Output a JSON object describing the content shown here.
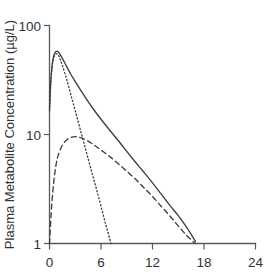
{
  "chart_data": {
    "type": "line",
    "title": "",
    "subtitle": "",
    "xlabel": "",
    "ylabel": "Plasma Metabolite Concentration (µg/L)",
    "yscale": "log",
    "xscale": "linear",
    "xlim": [
      0,
      24
    ],
    "ylim": [
      1,
      100
    ],
    "xticks": [
      0,
      6,
      12,
      18,
      24
    ],
    "xticklabels": [
      "0",
      "6",
      "12",
      "18",
      "24"
    ],
    "yticks": [
      1,
      10,
      100
    ],
    "yticklabels": [
      "1",
      "10",
      "100"
    ],
    "grid": false,
    "legend": "none",
    "series": [
      {
        "name": "total-concentration",
        "style": "solid",
        "color": "#3b3f43",
        "x": [
          0.0,
          0.15,
          0.3,
          0.45,
          0.6,
          0.8,
          1.0,
          1.2,
          1.5,
          2.0,
          2.5,
          3.0,
          4.0,
          5.0,
          6.0,
          7.0,
          8.0,
          9.0,
          10.0,
          11.0,
          12.0,
          13.0,
          14.0,
          15.0,
          16.0,
          17.0
        ],
        "y": [
          17.0,
          31.0,
          43.0,
          51.0,
          55.5,
          58.0,
          57.5,
          55.0,
          50.0,
          42.0,
          35.5,
          30.5,
          23.0,
          17.6,
          13.8,
          11.0,
          8.8,
          7.0,
          5.6,
          4.5,
          3.6,
          2.85,
          2.25,
          1.8,
          1.4,
          1.05
        ]
      },
      {
        "name": "rapid-phase-component",
        "style": "dotted",
        "color": "#3b3f43",
        "x": [
          0.0,
          0.15,
          0.3,
          0.45,
          0.6,
          0.8,
          1.0,
          1.2,
          1.5,
          2.0,
          2.5,
          3.0,
          3.5,
          4.0,
          4.5,
          5.0,
          5.5,
          6.0,
          6.5,
          7.0,
          7.15
        ],
        "y": [
          16.5,
          30.0,
          41.5,
          49.0,
          53.0,
          55.0,
          54.0,
          50.0,
          43.0,
          32.0,
          23.0,
          16.5,
          11.8,
          8.4,
          6.0,
          4.3,
          3.1,
          2.2,
          1.55,
          1.12,
          1.0
        ]
      },
      {
        "name": "slow-phase-component",
        "style": "dashed",
        "color": "#3b3f43",
        "x": [
          0.0,
          0.25,
          0.5,
          0.75,
          1.0,
          1.5,
          2.0,
          2.5,
          3.0,
          3.5,
          4.0,
          5.0,
          6.0,
          7.0,
          8.0,
          9.0,
          10.0,
          11.0,
          12.0,
          13.0,
          14.0,
          15.0,
          16.0,
          17.0
        ],
        "y": [
          1.0,
          2.2,
          3.7,
          5.2,
          6.4,
          8.0,
          8.9,
          9.4,
          9.55,
          9.4,
          9.1,
          8.2,
          7.2,
          6.3,
          5.4,
          4.6,
          3.9,
          3.25,
          2.7,
          2.2,
          1.8,
          1.45,
          1.18,
          1.0
        ]
      }
    ]
  },
  "axes": {
    "y_title": "Plasma Metabolite Concentration (µg/L)",
    "y_tick_top": "100",
    "y_tick_mid": "10",
    "y_tick_bottom": "1",
    "x_tick_0": "0",
    "x_tick_1": "6",
    "x_tick_2": "12",
    "x_tick_3": "18",
    "x_tick_4": "24"
  }
}
